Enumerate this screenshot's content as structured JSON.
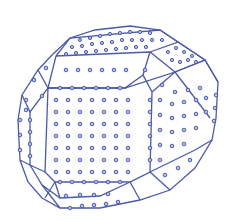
{
  "figure": {
    "colors": {
      "edge": "#4a5aa8",
      "atom_fill": "#b9c3ea",
      "atom_stroke": "#4a5aa8",
      "background": "#ffffff"
    },
    "faces": [
      {
        "name": "front-square-face",
        "grid": "7x7"
      },
      {
        "name": "top-face"
      },
      {
        "name": "left-face"
      },
      {
        "name": "right-face"
      },
      {
        "name": "top-left-facet"
      },
      {
        "name": "top-right-facet"
      },
      {
        "name": "bottom-right-facet"
      },
      {
        "name": "bottom-facet"
      }
    ]
  }
}
